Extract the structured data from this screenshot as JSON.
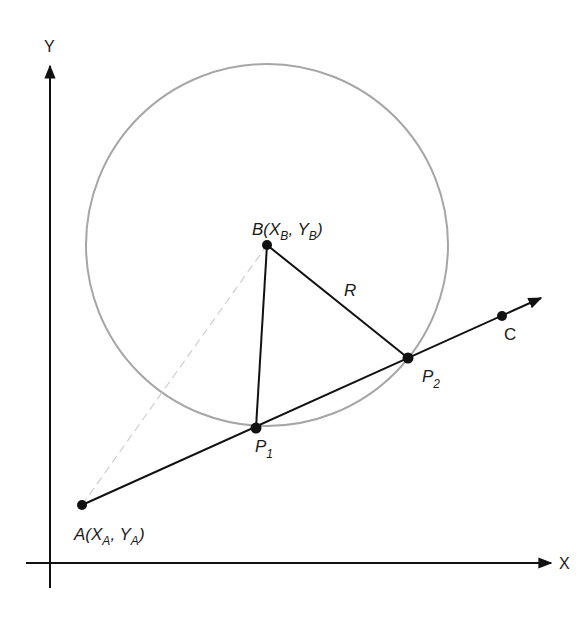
{
  "diagram": {
    "type": "geometry-line-circle-intersection",
    "axes": {
      "x_label": "X",
      "y_label": "Y"
    },
    "points": {
      "A": {
        "name": "A",
        "x_sym": "X",
        "x_sub": "A",
        "y_sym": "Y",
        "y_sub": "A"
      },
      "B": {
        "name": "B",
        "x_sym": "X",
        "x_sub": "B",
        "y_sym": "Y",
        "y_sub": "B"
      },
      "C": {
        "name": "C"
      },
      "P1": {
        "name": "P",
        "sub": "1"
      },
      "P2": {
        "name": "P",
        "sub": "2"
      }
    },
    "radius_label": "R",
    "colors": {
      "line": "#111111",
      "circle": "#a6a6a6",
      "dashed": "#c8c8c8"
    }
  }
}
